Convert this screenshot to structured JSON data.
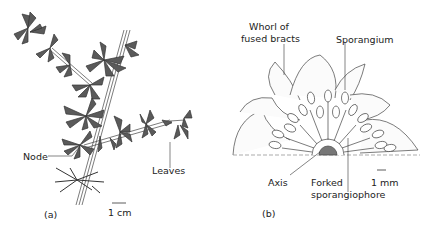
{
  "figure": {
    "panel_a": {
      "caption": "(a)",
      "labels": {
        "node": "Node",
        "leaves": "Leaves"
      },
      "scale_bar": "1 cm"
    },
    "panel_b": {
      "caption": "(b)",
      "labels": {
        "whorl_line1": "Whorl of",
        "whorl_line2": "fused bracts",
        "sporangium": "Sporangium",
        "axis": "Axis",
        "forked_line1": "Forked",
        "forked_line2": "sporangiophore"
      },
      "scale_bar": "1 mm"
    }
  }
}
